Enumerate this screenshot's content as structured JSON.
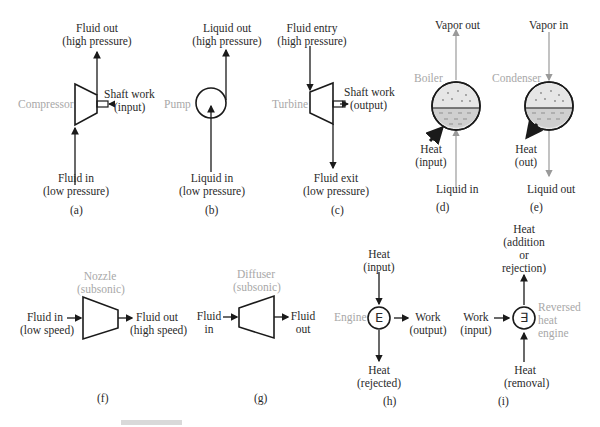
{
  "figure": {
    "panels": [
      {
        "id": "a",
        "caption": "(a)",
        "device": "Compressor",
        "top_label": [
          "Fluid out",
          "(high pressure)"
        ],
        "bottom_label": [
          "Fluid in",
          "(low pressure)"
        ],
        "side_label": [
          "Shaft work",
          "(input)"
        ]
      },
      {
        "id": "b",
        "caption": "(b)",
        "device": "Pump",
        "top_label": [
          "Liquid out",
          "(high pressure)"
        ],
        "bottom_label": [
          "Liquid in",
          "(low pressure)"
        ]
      },
      {
        "id": "c",
        "caption": "(c)",
        "device": "Turbine",
        "top_label": [
          "Fluid entry",
          "(high pressure)"
        ],
        "bottom_label": [
          "Fluid exit",
          "(low pressure)"
        ],
        "side_label": [
          "Shaft work",
          "(output)"
        ]
      },
      {
        "id": "d",
        "caption": "(d)",
        "device": "Boiler",
        "top_label": [
          "Vapor out"
        ],
        "bottom_label": [
          "Liquid in"
        ],
        "heat_label": [
          "Heat",
          "(input)"
        ]
      },
      {
        "id": "e",
        "caption": "(e)",
        "device": "Condenser",
        "top_label": [
          "Vapor in"
        ],
        "bottom_label": [
          "Liquid out"
        ],
        "heat_label": [
          "Heat",
          "(out)"
        ]
      },
      {
        "id": "f",
        "caption": "(f)",
        "device": [
          "Nozzle",
          "(subsonic)"
        ],
        "left_label": [
          "Fluid in",
          "(low speed)"
        ],
        "right_label": [
          "Fluid out",
          "(high speed)"
        ]
      },
      {
        "id": "g",
        "caption": "(g)",
        "device": [
          "Diffuser",
          "(subsonic)"
        ],
        "left_label": [
          "Fluid",
          "in"
        ],
        "right_label": [
          "Fluid",
          "out"
        ]
      },
      {
        "id": "h",
        "caption": "(h)",
        "device": "Engine",
        "symbol": "E",
        "top_label": [
          "Heat",
          "(input)"
        ],
        "bottom_label": [
          "Heat",
          "(rejected)"
        ],
        "right_label": [
          "Work",
          "(output)"
        ]
      },
      {
        "id": "i",
        "caption": "(i)",
        "device": [
          "Reversed",
          "heat",
          "engine"
        ],
        "symbol": "∃",
        "top_label": [
          "Heat",
          "(addition",
          "or",
          "rejection)"
        ],
        "bottom_label": [
          "Heat",
          "(removal)"
        ],
        "left_label": [
          "Work",
          "(input)"
        ]
      }
    ]
  },
  "colors": {
    "line": "#1a1a1a",
    "device_label": "#a8a8a8",
    "vessel_fill": "#e6e6e6",
    "liquid_fill": "#cfcfcf",
    "gray_line": "#9a9a9a"
  }
}
